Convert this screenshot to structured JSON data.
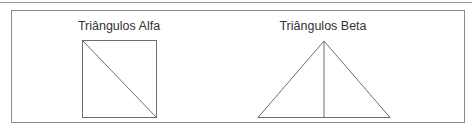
{
  "figures": [
    {
      "title": "Triângulos Alfa",
      "shape": "square-with-diagonal"
    },
    {
      "title": "Triângulos Beta",
      "shape": "triangle-with-altitude"
    }
  ],
  "colors": {
    "line": "#6e6e6e",
    "text": "#333333"
  }
}
